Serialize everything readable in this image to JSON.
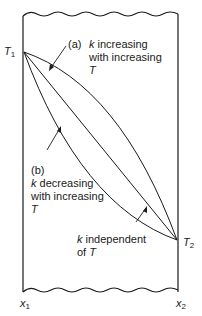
{
  "diagram": {
    "labels": {
      "t1": "T",
      "t1_sub": "1",
      "t2": "T",
      "t2_sub": "2",
      "x1": "x",
      "x1_sub": "1",
      "x2": "x",
      "x2_sub": "2"
    },
    "annotations": {
      "a_tag": "(a)",
      "a_line1_k": "k",
      "a_line1_rest": " increasing",
      "a_line2": "with increasing",
      "a_line3": "T",
      "b_tag": "(b)",
      "b_line1_k": "k",
      "b_line1_rest": " decreasing",
      "b_line2": "with increasing",
      "b_line3": "T",
      "c_line1_k": "k",
      "c_line1_rest": " independent",
      "c_line2_pre": "of ",
      "c_line2_T": "T"
    },
    "colors": {
      "ink": "#1a1a1a",
      "background": "#ffffff"
    }
  }
}
